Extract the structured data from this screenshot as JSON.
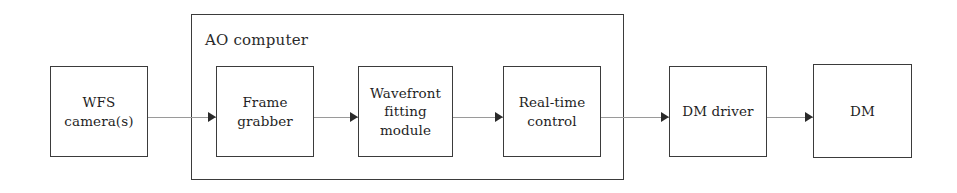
{
  "diagram": {
    "background_color": "#ffffff",
    "border_color": "#3b3b3b",
    "connector_color": "#9a9a9a",
    "arrowhead_color": "#2a2a2a",
    "text_color": "#1f1f1f"
  },
  "group": {
    "label": "AO computer",
    "x": 191,
    "y": 14,
    "width": 433,
    "height": 166,
    "label_x": 205,
    "label_y": 31
  },
  "blocks": [
    {
      "id": "wfs-camera",
      "label": "WFS\ncamera(s)",
      "x": 50,
      "y": 66,
      "width": 98,
      "height": 91,
      "inside_group": false
    },
    {
      "id": "frame-grabber",
      "label": "Frame\ngrabber",
      "x": 216,
      "y": 66,
      "width": 98,
      "height": 91,
      "inside_group": true
    },
    {
      "id": "wavefront-fitting-module",
      "label": "Wavefront\nfitting\nmodule",
      "x": 358,
      "y": 66,
      "width": 95,
      "height": 91,
      "inside_group": true
    },
    {
      "id": "real-time-control",
      "label": "Real-time\ncontrol",
      "x": 503,
      "y": 66,
      "width": 98,
      "height": 91,
      "inside_group": true
    },
    {
      "id": "dm-driver",
      "label": "DM driver",
      "x": 669,
      "y": 66,
      "width": 98,
      "height": 91,
      "inside_group": false
    },
    {
      "id": "dm",
      "label": "DM",
      "x": 813,
      "y": 64,
      "width": 99,
      "height": 94,
      "inside_group": false
    }
  ],
  "connectors": [
    {
      "id": "wfs-to-frame-grabber",
      "from": "wfs-camera",
      "to": "frame-grabber",
      "x": 148,
      "y": 117,
      "length": 68,
      "arrow_x": 208,
      "arrow_y": 112
    },
    {
      "id": "frame-grabber-to-wavefront",
      "from": "frame-grabber",
      "to": "wavefront-fitting-module",
      "x": 314,
      "y": 117,
      "length": 44,
      "arrow_x": 350,
      "arrow_y": 112
    },
    {
      "id": "wavefront-to-real-time-control",
      "from": "wavefront-fitting-module",
      "to": "real-time-control",
      "x": 453,
      "y": 117,
      "length": 50,
      "arrow_x": 495,
      "arrow_y": 112
    },
    {
      "id": "real-time-control-to-dm-driver",
      "from": "real-time-control",
      "to": "dm-driver",
      "x": 601,
      "y": 117,
      "length": 68,
      "arrow_x": 661,
      "arrow_y": 112
    },
    {
      "id": "dm-driver-to-dm",
      "from": "dm-driver",
      "to": "dm",
      "x": 767,
      "y": 117,
      "length": 46,
      "arrow_x": 805,
      "arrow_y": 112
    }
  ]
}
